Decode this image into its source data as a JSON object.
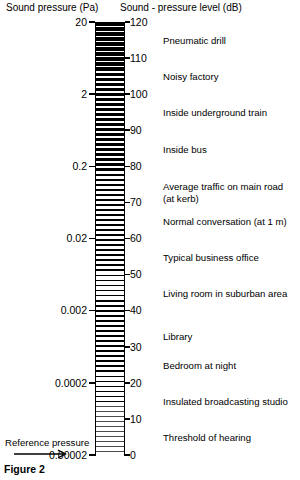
{
  "headings": {
    "pressure": "Sound pressure (Pa)",
    "level": "Sound - pressure level (dB)"
  },
  "caption": "Figure 2",
  "reference": {
    "label": "Reference pressure",
    "arrow_icon": "right-arrow-icon"
  },
  "chart_data": {
    "type": "bar",
    "subtitle": "",
    "xlabel": "",
    "ylabel": "Sound - pressure level (dB)",
    "secondary_ylabel": "Sound pressure (Pa)",
    "grid": false,
    "legend": null,
    "orientation": "vertical",
    "ylim": [
      0,
      120
    ],
    "y_ticks_db": [
      0,
      10,
      20,
      30,
      40,
      50,
      60,
      70,
      80,
      90,
      100,
      110,
      120
    ],
    "y_tick_labels_db": [
      "0",
      "10",
      "20",
      "30",
      "40",
      "50",
      "60",
      "70",
      "80",
      "90",
      "100",
      "110",
      "120"
    ],
    "secondary_ticks_db": [
      20,
      40,
      60,
      80,
      100,
      120
    ],
    "secondary_tick_labels_pa": [
      "0.00002",
      "0.0002",
      "0.002",
      "0.02",
      "0.2",
      "2",
      "20"
    ],
    "secondary_tick_values_pa": [
      2e-05,
      0.0002,
      0.002,
      0.02,
      0.2,
      2,
      20
    ],
    "secondary_ticks_db_full": [
      0,
      20,
      40,
      60,
      80,
      100,
      120
    ],
    "annotations": [
      {
        "label": "Pneumatic drill",
        "db": 115,
        "pa": 11.2
      },
      {
        "label": "Noisy factory",
        "db": 105,
        "pa": 3.55
      },
      {
        "label": "Inside underground train",
        "db": 95,
        "pa": 1.12
      },
      {
        "label": "Inside bus",
        "db": 85,
        "pa": 0.355
      },
      {
        "label": "Average traffic on main road\n(at kerb)",
        "db": 73,
        "pa": 0.089
      },
      {
        "label": "Normal conversation (at 1 m)",
        "db": 65,
        "pa": 0.0355
      },
      {
        "label": "Typical business office",
        "db": 55,
        "pa": 0.0112
      },
      {
        "label": "Living room in suburban area",
        "db": 45,
        "pa": 0.00355
      },
      {
        "label": "Library",
        "db": 33,
        "pa": 0.00089
      },
      {
        "label": "Bedroom at night",
        "db": 25,
        "pa": 0.000355
      },
      {
        "label": "Insulated broadcasting studio",
        "db": 15,
        "pa": 0.000112
      },
      {
        "label": "Threshold of hearing",
        "db": 5,
        "pa": 3.55e-05
      }
    ]
  }
}
